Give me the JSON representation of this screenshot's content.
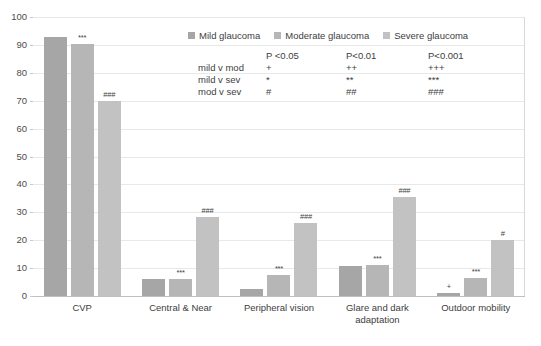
{
  "chart_data": {
    "type": "bar",
    "title": "",
    "xlabel": "",
    "ylabel": "",
    "ylim": [
      0,
      100
    ],
    "yticks": [
      0,
      10,
      20,
      30,
      40,
      50,
      60,
      70,
      80,
      90,
      100
    ],
    "grid": true,
    "legend_position": "top-center",
    "categories": [
      "CVP",
      "Central & Near",
      "Peripheral vision",
      "Glare and dark adaptation",
      "Outdoor mobility"
    ],
    "series": [
      {
        "name": "Mild glaucoma",
        "color": "#a6a6a6",
        "values": [
          93,
          6,
          2.5,
          10.8,
          1
        ]
      },
      {
        "name": "Moderate glaucoma",
        "color": "#b6b6b6",
        "values": [
          90.3,
          6.2,
          7.5,
          11.2,
          6.5
        ]
      },
      {
        "name": "Severe glaucoma",
        "color": "#c2c2c2",
        "values": [
          70,
          28.5,
          26,
          35.5,
          20
        ]
      }
    ],
    "bar_annotations": [
      {
        "category": "CVP",
        "series": "Moderate glaucoma",
        "text": "***"
      },
      {
        "category": "CVP",
        "series": "Severe glaucoma",
        "text": "###"
      },
      {
        "category": "Central & Near",
        "series": "Moderate glaucoma",
        "text": "***"
      },
      {
        "category": "Central & Near",
        "series": "Severe glaucoma",
        "text": "###"
      },
      {
        "category": "Peripheral vision",
        "series": "Moderate glaucoma",
        "text": "***"
      },
      {
        "category": "Peripheral vision",
        "series": "Severe glaucoma",
        "text": "###"
      },
      {
        "category": "Glare and dark adaptation",
        "series": "Moderate glaucoma",
        "text": "***"
      },
      {
        "category": "Glare and dark adaptation",
        "series": "Severe glaucoma",
        "text": "###"
      },
      {
        "category": "Outdoor mobility",
        "series": "Mild glaucoma",
        "text": "+"
      },
      {
        "category": "Outdoor mobility",
        "series": "Moderate glaucoma",
        "text": "***"
      },
      {
        "category": "Outdoor mobility",
        "series": "Severe glaucoma",
        "text": "#"
      }
    ]
  },
  "legend": {
    "items": [
      {
        "label": "Mild glaucoma"
      },
      {
        "label": "Moderate glaucoma"
      },
      {
        "label": "Severe glaucoma"
      }
    ]
  },
  "sig_key": {
    "corner": "",
    "headers": [
      "P <0.05",
      "P<0.01",
      "P<0.001"
    ],
    "rows": [
      {
        "label": "mild v mod",
        "cells": [
          "+",
          "++",
          "+++"
        ]
      },
      {
        "label": "mild v sev",
        "cells": [
          "*",
          "**",
          "***"
        ]
      },
      {
        "label": "mod v sev",
        "cells": [
          "#",
          "##",
          "###"
        ]
      }
    ]
  },
  "axis": {
    "y_tick_labels": [
      "100",
      "90",
      "80",
      "70",
      "60",
      "50",
      "40",
      "30",
      "20",
      "10",
      "0"
    ]
  }
}
